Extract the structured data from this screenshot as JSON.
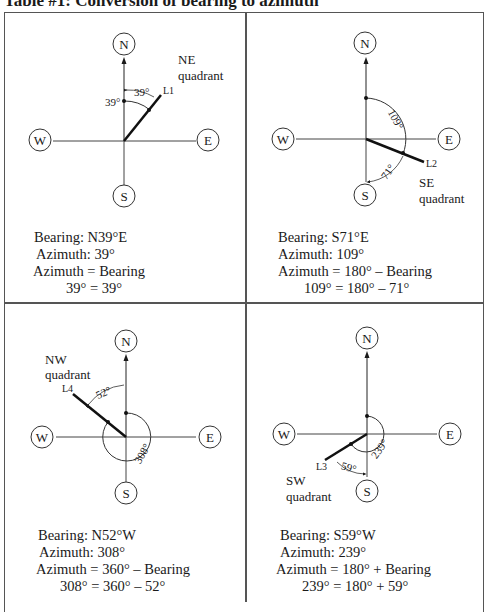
{
  "title": "Table #1:  Conversion of bearing to azimuth",
  "compass_labels": {
    "north": "N",
    "south": "S",
    "east": "E",
    "west": "W"
  },
  "cells": [
    {
      "id": "ne",
      "quadrant_line1": "NE",
      "quadrant_line2": "quadrant",
      "line_label": "L1",
      "bearing_angle_label": "39°",
      "azimuth_angle_label": "39°",
      "bearing": "Bearing: N39°E",
      "azimuth": "Azimuth: 39°",
      "formula": "Azimuth = Bearing",
      "computation": "39° = 39°"
    },
    {
      "id": "se",
      "quadrant_line1": "SE",
      "quadrant_line2": "quadrant",
      "line_label": "L2",
      "bearing_angle_label": "71°",
      "azimuth_angle_label": "109°",
      "bearing": "Bearing: S71°E",
      "azimuth": "Azimuth: 109°",
      "formula": "Azimuth = 180° – Bearing",
      "computation": "109° = 180° – 71°"
    },
    {
      "id": "nw",
      "quadrant_line1": "NW",
      "quadrant_line2": "quadrant",
      "line_label": "L4",
      "bearing_angle_label": "52°",
      "azimuth_angle_label": "308°",
      "bearing": "Bearing: N52°W",
      "azimuth": "Azimuth: 308°",
      "formula": "Azimuth = 360° – Bearing",
      "computation": "308° = 360° – 52°"
    },
    {
      "id": "sw",
      "quadrant_line1": "SW",
      "quadrant_line2": "quadrant",
      "line_label": "L3",
      "bearing_angle_label": "59°",
      "azimuth_angle_label": "239°",
      "bearing": "Bearing: S59°W",
      "azimuth": "Azimuth: 239°",
      "formula": "Azimuth = 180° + Bearing",
      "computation": "239° = 180° + 59°"
    }
  ]
}
